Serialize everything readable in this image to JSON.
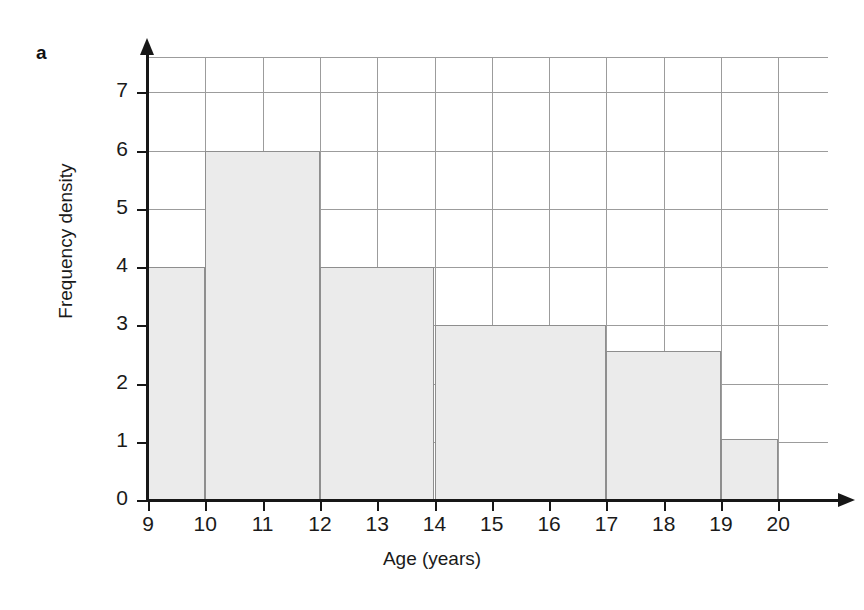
{
  "panel": {
    "letter": "a"
  },
  "chart_data": {
    "type": "bar",
    "title": "",
    "subtitle": "",
    "xlabel": "Age (years)",
    "ylabel": "Frequency density",
    "xlim": [
      9,
      20
    ],
    "ylim": [
      0,
      7.6
    ],
    "grid": true,
    "legend": null,
    "bar_style": {
      "fill": "#ebebeb",
      "stroke": "#8e8e8e"
    },
    "grid_color": "#9c9c9c",
    "axis_color": "#171717",
    "y_ticks": [
      0,
      1,
      2,
      3,
      4,
      5,
      6,
      7
    ],
    "y_tick_labels": [
      "0",
      "1",
      "2",
      "3",
      "4",
      "5",
      "6",
      "7"
    ],
    "x_ticks": [
      9,
      10,
      11,
      12,
      13,
      14,
      15,
      16,
      17,
      18,
      19,
      20
    ],
    "x_tick_labels": [
      "9",
      "10",
      "11",
      "12",
      "13",
      "14",
      "15",
      "16",
      "17",
      "18",
      "19",
      "20"
    ],
    "y_gridlines": [
      1,
      2,
      3,
      4,
      5,
      6,
      7,
      7.6
    ],
    "x_gridlines": [
      9,
      10,
      11,
      12,
      13,
      14,
      15,
      16,
      17,
      18,
      19,
      20
    ],
    "bins": [
      {
        "label": "9-10",
        "x_start": 9,
        "x_end": 10,
        "value": 4,
        "frequency": 4
      },
      {
        "label": "10-12",
        "x_start": 10,
        "x_end": 12,
        "value": 6,
        "frequency": 12
      },
      {
        "label": "12-14",
        "x_start": 12,
        "x_end": 14,
        "value": 4,
        "frequency": 8
      },
      {
        "label": "14-17",
        "x_start": 14,
        "x_end": 17,
        "value": 3,
        "frequency": 9
      },
      {
        "label": "17-19",
        "x_start": 17,
        "x_end": 19,
        "value": 2.55,
        "frequency": 5
      },
      {
        "label": "19-20",
        "x_start": 19,
        "x_end": 20,
        "value": 1.05,
        "frequency": 1
      }
    ]
  }
}
